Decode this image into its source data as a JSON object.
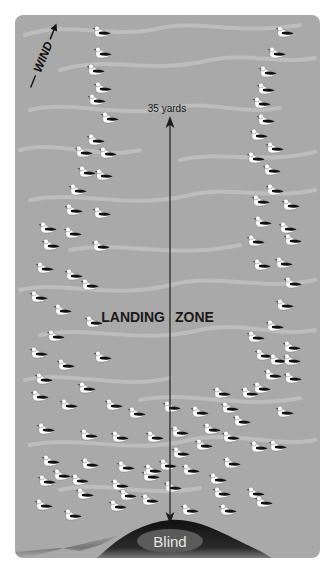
{
  "diagram": {
    "wind_label": "WIND",
    "distance_label": "35 yards",
    "zone_label_left": "LANDING",
    "zone_label_right": "ZONE",
    "blind_label": "Blind",
    "colors": {
      "water": "#a9a9a9",
      "ripple": "#c2c2c2",
      "arrow": "#1e1e1e",
      "bank": "#1a1a1a",
      "blind": "#5a5a5a",
      "blind_text": "#e6e6e6",
      "decoy_body": "#ffffff",
      "decoy_back": "#111111"
    },
    "decoys": [
      [
        102,
        32
      ],
      [
        285,
        32
      ],
      [
        103,
        53
      ],
      [
        277,
        53
      ],
      [
        96,
        70
      ],
      [
        268,
        72
      ],
      [
        103,
        88
      ],
      [
        266,
        89
      ],
      [
        97,
        100
      ],
      [
        262,
        103
      ],
      [
        110,
        118
      ],
      [
        266,
        120
      ],
      [
        96,
        140
      ],
      [
        259,
        135
      ],
      [
        108,
        153
      ],
      [
        275,
        148
      ],
      [
        84,
        152
      ],
      [
        272,
        170
      ],
      [
        87,
        172
      ],
      [
        256,
        158
      ],
      [
        78,
        190
      ],
      [
        275,
        190
      ],
      [
        104,
        175
      ],
      [
        261,
        201
      ],
      [
        74,
        210
      ],
      [
        291,
        205
      ],
      [
        102,
        213
      ],
      [
        263,
        222
      ],
      [
        48,
        228
      ],
      [
        288,
        228
      ],
      [
        73,
        233
      ],
      [
        256,
        241
      ],
      [
        51,
        245
      ],
      [
        262,
        265
      ],
      [
        101,
        246
      ],
      [
        293,
        240
      ],
      [
        45,
        268
      ],
      [
        284,
        263
      ],
      [
        74,
        275
      ],
      [
        293,
        283
      ],
      [
        90,
        285
      ],
      [
        285,
        305
      ],
      [
        39,
        297
      ],
      [
        275,
        326
      ],
      [
        63,
        310
      ],
      [
        256,
        337
      ],
      [
        94,
        322
      ],
      [
        264,
        355
      ],
      [
        56,
        336
      ],
      [
        292,
        347
      ],
      [
        39,
        353
      ],
      [
        278,
        360
      ],
      [
        66,
        365
      ],
      [
        292,
        360
      ],
      [
        103,
        357
      ],
      [
        273,
        375
      ],
      [
        44,
        379
      ],
      [
        293,
        378
      ],
      [
        87,
        388
      ],
      [
        250,
        393
      ],
      [
        40,
        396
      ],
      [
        222,
        393
      ],
      [
        69,
        405
      ],
      [
        230,
        408
      ],
      [
        114,
        405
      ],
      [
        200,
        412
      ],
      [
        172,
        407
      ],
      [
        262,
        388
      ],
      [
        137,
        413
      ],
      [
        242,
        421
      ],
      [
        46,
        429
      ],
      [
        285,
        412
      ],
      [
        89,
        435
      ],
      [
        212,
        429
      ],
      [
        120,
        437
      ],
      [
        278,
        446
      ],
      [
        155,
        437
      ],
      [
        180,
        432
      ],
      [
        204,
        445
      ],
      [
        231,
        437
      ],
      [
        51,
        461
      ],
      [
        181,
        453
      ],
      [
        90,
        464
      ],
      [
        259,
        447
      ],
      [
        168,
        465
      ],
      [
        232,
        463
      ],
      [
        126,
        467
      ],
      [
        191,
        470
      ],
      [
        62,
        475
      ],
      [
        151,
        476
      ],
      [
        47,
        481
      ],
      [
        218,
        479
      ],
      [
        85,
        494
      ],
      [
        222,
        493
      ],
      [
        128,
        495
      ],
      [
        256,
        493
      ],
      [
        44,
        505
      ],
      [
        173,
        487
      ],
      [
        73,
        515
      ],
      [
        150,
        500
      ],
      [
        118,
        506
      ],
      [
        228,
        510
      ],
      [
        190,
        510
      ],
      [
        264,
        502
      ],
      [
        153,
        470
      ],
      [
        120,
        485
      ],
      [
        80,
        480
      ]
    ]
  }
}
